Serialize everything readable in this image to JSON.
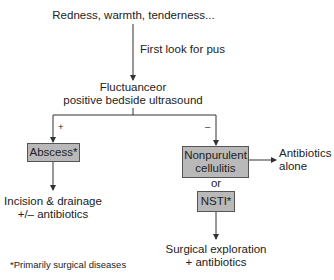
{
  "diagram": {
    "start": "Redness, warmth, tenderness...",
    "first_step_label": "First look for pus",
    "decision": {
      "line1": "Fluctuanceor",
      "line2": "positive bedside ultrasound"
    },
    "branch_positive": {
      "sign": "+",
      "box": "Abscess*",
      "outcome_line1": "Incision & drainage",
      "outcome_line2": "+/– antibiotics"
    },
    "branch_negative": {
      "sign": "–",
      "box_line1": "Nonpurulent",
      "box_line2": "cellulitis",
      "side_outcome_line1": "Antibiotics",
      "side_outcome_line2": "alone",
      "or_label": "or",
      "alt_box": "NSTI*",
      "alt_outcome_line1": "Surgical exploration",
      "alt_outcome_line2": "+ antibiotics"
    },
    "footnote": "*Primarily surgical diseases"
  },
  "colors": {
    "box_fill": "#b9b9b9",
    "box_border": "#555555",
    "line": "#333333"
  }
}
